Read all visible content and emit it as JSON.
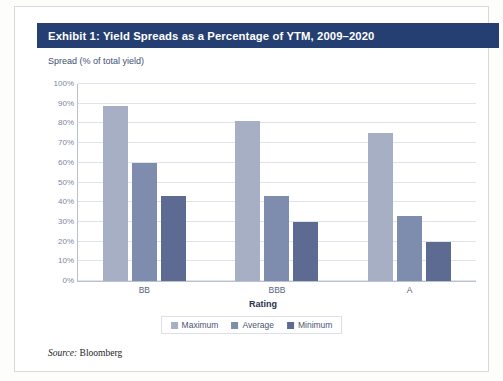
{
  "exhibit": {
    "title": "Exhibit 1: Yield Spreads as a Percentage of YTM, 2009–2020",
    "source_label": "Source:",
    "source_value": "Bloomberg"
  },
  "colors": {
    "title_banner": "#253F72",
    "maximum": "#A6AFC4",
    "average": "#7E8CAE",
    "minimum": "#5D6B92",
    "gridline": "#DFE3EC",
    "axis": "#B9C0D0"
  },
  "chart_data": {
    "type": "bar",
    "title": "Exhibit 1: Yield Spreads as a Percentage of YTM, 2009–2020",
    "subtitle": "",
    "xlabel": "Rating",
    "ylabel": "Spread (% of total yield)",
    "categories": [
      "BB",
      "BBB",
      "A"
    ],
    "series": [
      {
        "name": "Maximum",
        "values": [
          89,
          81,
          75
        ],
        "color": "#A6AFC4"
      },
      {
        "name": "Average",
        "values": [
          60,
          43,
          33
        ],
        "color": "#7E8CAE"
      },
      {
        "name": "Minimum",
        "values": [
          43,
          30,
          20
        ],
        "color": "#5D6B92"
      }
    ],
    "ylim": [
      0,
      100
    ],
    "ytick_values": [
      0,
      10,
      20,
      30,
      40,
      50,
      60,
      70,
      80,
      90,
      100
    ],
    "ytick_labels": [
      "0%",
      "10%",
      "20%",
      "30%",
      "40%",
      "50%",
      "60%",
      "70%",
      "80%",
      "90%",
      "100%"
    ],
    "grid": true,
    "legend_position": "bottom",
    "value_unit": "%"
  }
}
